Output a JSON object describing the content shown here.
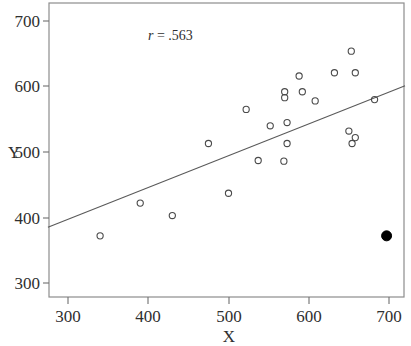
{
  "chart_data": {
    "type": "scatter",
    "title": "",
    "xlabel": "X",
    "ylabel": "Y",
    "xlim": [
      275,
      720
    ],
    "ylim": [
      275,
      712
    ],
    "xticks": [
      300,
      400,
      500,
      600,
      700
    ],
    "yticks": [
      300,
      400,
      500,
      600,
      700
    ],
    "xtick_labels": [
      "300",
      "400",
      "500",
      "600",
      "700"
    ],
    "ytick_labels": [
      "300",
      "400",
      "500",
      "600",
      "700"
    ],
    "grid": false,
    "legend": null,
    "annotations": [
      {
        "name": "correlation-annotation",
        "symbol": "r",
        "equals": " = ",
        "value": ".563",
        "text": "r = .563",
        "x": 400,
        "y": 672
      }
    ],
    "series": [
      {
        "name": "observations",
        "marker": "open-circle",
        "color": "#4a4a4a",
        "points": [
          {
            "x": 340,
            "y": 372
          },
          {
            "x": 390,
            "y": 422
          },
          {
            "x": 430,
            "y": 403
          },
          {
            "x": 475,
            "y": 513
          },
          {
            "x": 500,
            "y": 437
          },
          {
            "x": 522,
            "y": 565
          },
          {
            "x": 537,
            "y": 487
          },
          {
            "x": 552,
            "y": 540
          },
          {
            "x": 570,
            "y": 592
          },
          {
            "x": 570,
            "y": 583
          },
          {
            "x": 569,
            "y": 486
          },
          {
            "x": 573,
            "y": 545
          },
          {
            "x": 573,
            "y": 513
          },
          {
            "x": 588,
            "y": 616
          },
          {
            "x": 592,
            "y": 592
          },
          {
            "x": 608,
            "y": 578
          },
          {
            "x": 632,
            "y": 621
          },
          {
            "x": 650,
            "y": 532
          },
          {
            "x": 653,
            "y": 654
          },
          {
            "x": 654,
            "y": 513
          },
          {
            "x": 658,
            "y": 621
          },
          {
            "x": 658,
            "y": 522
          },
          {
            "x": 682,
            "y": 580
          }
        ]
      },
      {
        "name": "outlier",
        "marker": "filled-circle",
        "color": "#000000",
        "points": [
          {
            "x": 697,
            "y": 372
          }
        ]
      }
    ],
    "fit_line": {
      "name": "regression-line",
      "x_start": 275,
      "y_start": 385,
      "x_end": 720,
      "y_end": 601
    }
  }
}
